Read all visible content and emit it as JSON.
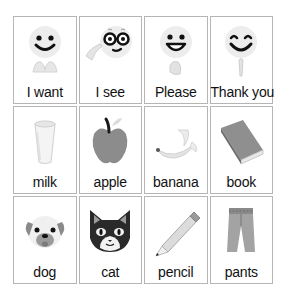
{
  "board": {
    "cards": [
      {
        "label": "I want",
        "icon": "i-want-icon"
      },
      {
        "label": "I see",
        "icon": "i-see-icon"
      },
      {
        "label": "Please",
        "icon": "please-icon"
      },
      {
        "label": "Thank you",
        "icon": "thank-you-icon"
      },
      {
        "label": "milk",
        "icon": "milk-icon"
      },
      {
        "label": "apple",
        "icon": "apple-icon"
      },
      {
        "label": "banana",
        "icon": "banana-icon"
      },
      {
        "label": "book",
        "icon": "book-icon"
      },
      {
        "label": "dog",
        "icon": "dog-icon"
      },
      {
        "label": "cat",
        "icon": "cat-icon"
      },
      {
        "label": "pencil",
        "icon": "pencil-icon"
      },
      {
        "label": "pants",
        "icon": "pants-icon"
      }
    ]
  },
  "colors": {
    "border": "#b5b5b5",
    "face": "#ececec",
    "feature": "#111111",
    "object_gray": "#8a8a8a",
    "light_gray": "#d8d8d8"
  }
}
